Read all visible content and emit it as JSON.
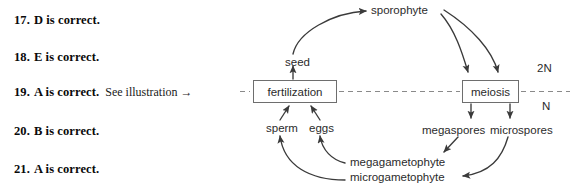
{
  "answers": {
    "items": [
      {
        "number": "17.",
        "text": "D is correct.",
        "note": ""
      },
      {
        "number": "18.",
        "text": "E is correct.",
        "note": ""
      },
      {
        "number": "19.",
        "text": "A is correct.",
        "note": "See illustration →"
      },
      {
        "number": "20.",
        "text": "B is correct.",
        "note": ""
      },
      {
        "number": "21.",
        "text": "A is correct.",
        "note": ""
      }
    ]
  },
  "diagram": {
    "boxes": {
      "fertilization": "fertilization",
      "meiosis": "meiosis"
    },
    "labels": {
      "sporophyte": "sporophyte",
      "seed": "seed",
      "sperm": "sperm",
      "eggs": "eggs",
      "megaspores": "megaspores",
      "microspores": "microspores",
      "megagametophyte": "megagametophyte",
      "microgametophyte": "microgametophyte",
      "ploidy_diploid": "2N",
      "ploidy_haploid": "N"
    },
    "colors": {
      "stroke": "#3a3a3a",
      "box_border": "#6e6e6e",
      "dashed_line": "#8a8a8a",
      "text": "#2b2b2b",
      "background": "#ffffff"
    }
  }
}
